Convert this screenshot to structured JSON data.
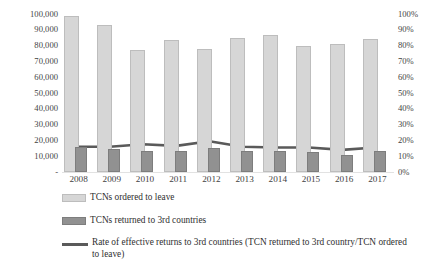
{
  "chart_data": {
    "type": "bar",
    "title": "",
    "subtitle": "",
    "xlabel": "",
    "ylabel": "",
    "y2label": "",
    "grid": false,
    "legend_position": "bottom",
    "categories": [
      "2008",
      "2009",
      "2010",
      "2011",
      "2012",
      "2013",
      "2014",
      "2015",
      "2016",
      "2017"
    ],
    "ylim": [
      0,
      100000
    ],
    "y2lim": [
      0,
      100
    ],
    "y_ticks": [
      "-",
      "10,000",
      "20,000",
      "30,000",
      "40,000",
      "50,000",
      "60,000",
      "70,000",
      "80,000",
      "90,000",
      "100,000"
    ],
    "y2_ticks": [
      "0%",
      "10%",
      "20%",
      "30%",
      "40%",
      "50%",
      "60%",
      "70%",
      "80%",
      "90%",
      "100%"
    ],
    "series": [
      {
        "name": "TCNs ordered to leave",
        "type": "bar",
        "axis": "left",
        "color": "#d6d6d6",
        "values": [
          99000,
          93000,
          77000,
          83500,
          78000,
          85000,
          87000,
          80000,
          81000,
          84500
        ]
      },
      {
        "name": "TCNs returned to 3rd countries",
        "type": "bar",
        "axis": "left",
        "color": "#919191",
        "values": [
          16000,
          14500,
          13500,
          13500,
          15000,
          13500,
          13500,
          12500,
          11000,
          13000
        ]
      },
      {
        "name": "Rate of effective returns to 3rd countries (TCN returned to 3rd country/TCN ordered to leave)",
        "type": "line",
        "axis": "right",
        "color": "#5a5a5a",
        "values": [
          16,
          16,
          17.5,
          16.5,
          19.5,
          16,
          15.5,
          15.5,
          14,
          15.5
        ]
      }
    ]
  },
  "legend": {
    "items": [
      {
        "key": "swatch-light",
        "label": "TCNs ordered to leave"
      },
      {
        "key": "swatch-dark",
        "label": "TCNs returned to 3rd countries"
      },
      {
        "key": "swatch-line",
        "label": "Rate of effective returns to 3rd countries (TCN returned to 3rd country/TCN ordered to leave)"
      }
    ]
  },
  "colors": {
    "bar_ordered": "#d6d6d6",
    "bar_returned": "#919191",
    "line": "#5a5a5a",
    "text": "#3a3a3a",
    "background": "#ffffff"
  }
}
